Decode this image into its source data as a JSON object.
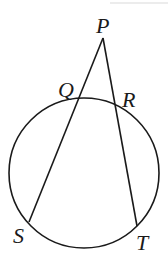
{
  "diagram": {
    "type": "circle-secants",
    "stroke_color": "#1a1a1a",
    "circle": {
      "cx": 84,
      "cy": 173,
      "r": 75
    },
    "points": {
      "P": {
        "label": "P",
        "x": 103,
        "y": 38
      },
      "Q": {
        "label": "Q",
        "x": 79,
        "y": 100
      },
      "R": {
        "label": "R",
        "x": 115,
        "y": 106
      },
      "S": {
        "label": "S",
        "x": 29,
        "y": 222
      },
      "T": {
        "label": "T",
        "x": 137,
        "y": 226
      }
    },
    "segments": [
      [
        "P",
        "S"
      ],
      [
        "P",
        "T"
      ]
    ]
  }
}
